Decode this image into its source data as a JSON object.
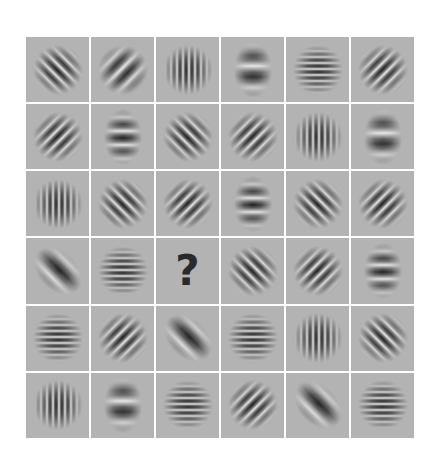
{
  "puzzle": {
    "type": "gabor-patch-grid",
    "rows": 6,
    "columns": 6,
    "background_color": "#b3b3b3",
    "divider_color": "#ffffff",
    "missing_cell": {
      "row": 4,
      "col": 3,
      "label": "?"
    },
    "cells": [
      [
        {
          "orientation": 45,
          "frequency": "medium",
          "elongated": false
        },
        {
          "orientation": -45,
          "frequency": "low",
          "elongated": false
        },
        {
          "orientation": 0,
          "frequency": "high",
          "elongated": false
        },
        {
          "orientation": 90,
          "frequency": "blob",
          "elongated": true
        },
        {
          "orientation": 90,
          "frequency": "high",
          "elongated": false
        },
        {
          "orientation": -45,
          "frequency": "medium",
          "elongated": false
        }
      ],
      [
        {
          "orientation": -45,
          "frequency": "medium",
          "elongated": false
        },
        {
          "orientation": 90,
          "frequency": "low",
          "elongated": true
        },
        {
          "orientation": 45,
          "frequency": "medium",
          "elongated": false
        },
        {
          "orientation": -45,
          "frequency": "medium",
          "elongated": false
        },
        {
          "orientation": 0,
          "frequency": "high",
          "elongated": false
        },
        {
          "orientation": 90,
          "frequency": "blob",
          "elongated": true
        }
      ],
      [
        {
          "orientation": 0,
          "frequency": "high",
          "elongated": false
        },
        {
          "orientation": 45,
          "frequency": "medium",
          "elongated": false
        },
        {
          "orientation": -45,
          "frequency": "medium",
          "elongated": false
        },
        {
          "orientation": 90,
          "frequency": "low",
          "elongated": true
        },
        {
          "orientation": 45,
          "frequency": "medium",
          "elongated": false
        },
        {
          "orientation": -45,
          "frequency": "medium",
          "elongated": false
        }
      ],
      [
        {
          "orientation": -45,
          "frequency": "blob",
          "elongated": true
        },
        {
          "orientation": 90,
          "frequency": "high",
          "elongated": false
        },
        {
          "missing": true,
          "label": "?"
        },
        {
          "orientation": 45,
          "frequency": "medium",
          "elongated": false
        },
        {
          "orientation": -45,
          "frequency": "medium",
          "elongated": false
        },
        {
          "orientation": 90,
          "frequency": "low",
          "elongated": true
        }
      ],
      [
        {
          "orientation": 90,
          "frequency": "high",
          "elongated": false
        },
        {
          "orientation": -45,
          "frequency": "medium",
          "elongated": false
        },
        {
          "orientation": -45,
          "frequency": "blob",
          "elongated": true
        },
        {
          "orientation": 90,
          "frequency": "high",
          "elongated": false
        },
        {
          "orientation": 0,
          "frequency": "high",
          "elongated": false
        },
        {
          "orientation": 45,
          "frequency": "medium",
          "elongated": false
        }
      ],
      [
        {
          "orientation": 0,
          "frequency": "high",
          "elongated": false
        },
        {
          "orientation": 90,
          "frequency": "blob",
          "elongated": true
        },
        {
          "orientation": 90,
          "frequency": "high",
          "elongated": false
        },
        {
          "orientation": -45,
          "frequency": "medium",
          "elongated": false
        },
        {
          "orientation": -45,
          "frequency": "blob",
          "elongated": true
        },
        {
          "orientation": 90,
          "frequency": "high",
          "elongated": false
        }
      ]
    ]
  }
}
